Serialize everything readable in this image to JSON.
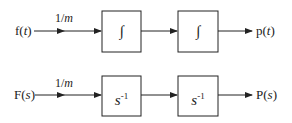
{
  "diagram": {
    "time_domain": {
      "input": "f(t)",
      "input_prefix": "f(",
      "input_var": "t",
      "input_suffix": ")",
      "gain": "1/m",
      "gain_num": "1/",
      "gain_var": "m",
      "blocks": [
        "∫",
        "∫"
      ],
      "output": "p(t)",
      "output_prefix": "p(",
      "output_var": "t",
      "output_suffix": ")"
    },
    "laplace_domain": {
      "input": "F(s)",
      "input_prefix": "F(",
      "input_var": "s",
      "input_suffix": ")",
      "gain": "1/m",
      "gain_num": "1/",
      "gain_var": "m",
      "blocks": [
        {
          "base": "s",
          "exponent": "-1"
        },
        {
          "base": "s",
          "exponent": "-1"
        }
      ],
      "output": "P(s)",
      "output_prefix": "P(",
      "output_var": "s",
      "output_suffix": ")"
    }
  },
  "colors": {
    "line": "#222222",
    "background": "#ffffff"
  }
}
